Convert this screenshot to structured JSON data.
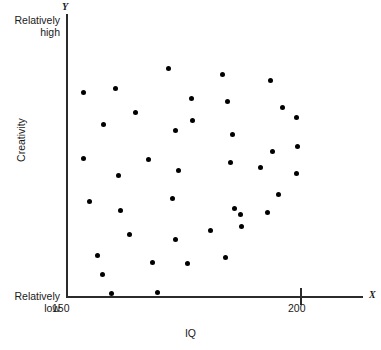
{
  "figure": {
    "width": 381,
    "height": 350,
    "background": "#ffffff",
    "point_color": "#000000",
    "axis_color": "#2b2b2b"
  },
  "axes": {
    "y_letter": "Y",
    "x_letter": "X",
    "y_title": "Creativity",
    "x_title": "IQ",
    "anchor_high": "Relatively\nhigh",
    "anchor_high_line1": "Relatively",
    "anchor_high_line2": "high",
    "anchor_low_line1": "Relatively",
    "anchor_low_line2": "low",
    "x_tick_labels": [
      "150",
      "200"
    ]
  },
  "chart_data": {
    "type": "scatter",
    "title": "",
    "xlabel": "IQ",
    "ylabel": "Creativity",
    "xlim": [
      150,
      200
    ],
    "ylim": [
      0,
      100
    ],
    "grid": false,
    "legend": null,
    "x_ticks": [
      150,
      200
    ],
    "x_tick_labels": [
      "150",
      "200"
    ],
    "y_ticks": [],
    "y_tick_labels": [],
    "y_axis_annotations": {
      "top": "Relatively high",
      "bottom": "Relatively low"
    },
    "n_points": 41,
    "marker": "circle",
    "marker_size_px": 5,
    "series": [
      {
        "name": "Participants",
        "points": [
          {
            "px": 168,
            "py": 68,
            "x": 171.8,
            "y": 81.0
          },
          {
            "px": 83,
            "py": 92,
            "x": 153.6,
            "y": 72.5
          },
          {
            "px": 115,
            "py": 88,
            "x": 160.5,
            "y": 73.9
          },
          {
            "px": 135,
            "py": 112,
            "x": 164.7,
            "y": 65.5
          },
          {
            "px": 103,
            "py": 124,
            "x": 157.9,
            "y": 61.3
          },
          {
            "px": 175,
            "py": 130,
            "x": 173.3,
            "y": 59.2
          },
          {
            "px": 83,
            "py": 158,
            "x": 153.6,
            "y": 49.3
          },
          {
            "px": 148,
            "py": 159,
            "x": 167.5,
            "y": 48.9
          },
          {
            "px": 118,
            "py": 175,
            "x": 161.1,
            "y": 43.3
          },
          {
            "px": 178,
            "py": 170,
            "x": 173.9,
            "y": 45.1
          },
          {
            "px": 222,
            "py": 74,
            "x": 183.3,
            "y": 78.9
          },
          {
            "px": 270,
            "py": 80,
            "x": 193.6,
            "y": 76.8
          },
          {
            "px": 191,
            "py": 98,
            "x": 176.7,
            "y": 70.4
          },
          {
            "px": 227,
            "py": 101,
            "x": 184.4,
            "y": 69.4
          },
          {
            "px": 282,
            "py": 107,
            "x": 196.2,
            "y": 67.3
          },
          {
            "px": 296,
            "py": 117,
            "x": 199.1,
            "y": 63.7
          },
          {
            "px": 192,
            "py": 120,
            "x": 176.9,
            "y": 62.7
          },
          {
            "px": 232,
            "py": 134,
            "x": 185.5,
            "y": 57.7
          },
          {
            "px": 297,
            "py": 146,
            "x": 199.4,
            "y": 53.5
          },
          {
            "px": 272,
            "py": 151,
            "x": 194.0,
            "y": 51.8
          },
          {
            "px": 230,
            "py": 162,
            "x": 185.0,
            "y": 47.9
          },
          {
            "px": 260,
            "py": 167,
            "x": 191.5,
            "y": 46.1
          },
          {
            "px": 296,
            "py": 173,
            "x": 199.1,
            "y": 44.0
          },
          {
            "px": 89,
            "py": 201,
            "x": 154.9,
            "y": 34.2
          },
          {
            "px": 172,
            "py": 198,
            "x": 172.6,
            "y": 35.2
          },
          {
            "px": 120,
            "py": 210,
            "x": 161.5,
            "y": 31.0
          },
          {
            "px": 129,
            "py": 234,
            "x": 163.5,
            "y": 22.5
          },
          {
            "px": 175,
            "py": 239,
            "x": 173.3,
            "y": 20.8
          },
          {
            "px": 97,
            "py": 255,
            "x": 156.6,
            "y": 15.1
          },
          {
            "px": 152,
            "py": 262,
            "x": 168.4,
            "y": 12.7
          },
          {
            "px": 102,
            "py": 274,
            "x": 157.7,
            "y": 8.5
          },
          {
            "px": 111,
            "py": 293,
            "x": 159.6,
            "y": 1.8
          },
          {
            "px": 157,
            "py": 292,
            "x": 169.4,
            "y": 2.1
          },
          {
            "px": 278,
            "py": 194,
            "x": 195.3,
            "y": 36.6
          },
          {
            "px": 234,
            "py": 208,
            "x": 185.9,
            "y": 31.7
          },
          {
            "px": 267,
            "py": 212,
            "x": 192.9,
            "y": 30.3
          },
          {
            "px": 240,
            "py": 214,
            "x": 187.2,
            "y": 29.6
          },
          {
            "px": 241,
            "py": 226,
            "x": 187.4,
            "y": 25.4
          },
          {
            "px": 210,
            "py": 230,
            "x": 180.8,
            "y": 23.9
          },
          {
            "px": 225,
            "py": 257,
            "x": 184.0,
            "y": 14.4
          },
          {
            "px": 187,
            "py": 263,
            "x": 175.9,
            "y": 12.3
          }
        ]
      }
    ]
  }
}
